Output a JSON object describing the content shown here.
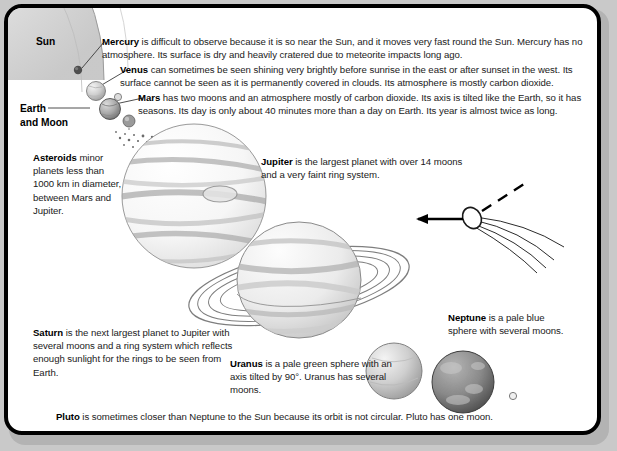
{
  "diagram": {
    "background_color": "#c9c9c9",
    "panel_color": "#ffffff",
    "border_color": "#000000",
    "labels": {
      "sun": "Sun",
      "earth_and_moon": "Earth\nand Moon"
    },
    "entries": [
      {
        "id": "mercury",
        "name": "Mercury",
        "text": " is difficult to observe because it is so near the Sun, and it moves very fast round the Sun. Mercury has no atmosphere. Its surface is dry and heavily cratered due to meteorite impacts long ago."
      },
      {
        "id": "venus",
        "name": "Venus",
        "text": " can sometimes be seen shining very brightly before sunrise in the east or after sunset in the west. Its surface cannot be seen as it is permanently covered in clouds. Its atmosphere is mostly carbon dioxide."
      },
      {
        "id": "mars",
        "name": "Mars",
        "text": " has two moons and an atmosphere mostly of carbon dioxide. Its axis is tilted like the Earth, so it has seasons. Its day is only about 40 minutes more than a day on Earth. Its year is almost twice as long."
      },
      {
        "id": "asteroids",
        "name": "Asteroids",
        "text": " minor planets less than 1000 km in diameter, between Mars and Jupiter."
      },
      {
        "id": "jupiter",
        "name": "Jupiter",
        "text": " is the largest planet with over 14 moons and a very faint ring system."
      },
      {
        "id": "saturn",
        "name": "Saturn",
        "text": " is the next largest planet to Jupiter with several moons and a ring system which reflects enough sunlight for the rings to be seen from Earth."
      },
      {
        "id": "uranus",
        "name": "Uranus",
        "text": " is a pale green sphere with an axis tilted by 90°. Uranus has several moons."
      },
      {
        "id": "neptune",
        "name": "Neptune",
        "text": " is a pale blue sphere with several moons."
      },
      {
        "id": "pluto",
        "name": "Pluto",
        "text": " is sometimes closer than Neptune to the Sun because its orbit is not circular. Pluto has one moon."
      }
    ],
    "illustrations": [
      {
        "name": "sun-arc",
        "description": "large pale arc of the Sun in the top-left corner"
      },
      {
        "name": "mercury-dot",
        "description": "small dark dot"
      },
      {
        "name": "venus-sphere",
        "description": "small light grey sphere"
      },
      {
        "name": "earth-sphere",
        "description": "grey sphere with tiny moon"
      },
      {
        "name": "mars-dot",
        "description": "small grey dot"
      },
      {
        "name": "asteroid-belt",
        "description": "diagonal scatter of tiny dots"
      },
      {
        "name": "jupiter-sphere",
        "description": "large banded sphere"
      },
      {
        "name": "saturn-sphere",
        "description": "banded sphere with rings"
      },
      {
        "name": "comet",
        "description": "comet head with tail, motion arrow and dashed orbit line"
      },
      {
        "name": "uranus-sphere",
        "description": "pale green sphere"
      },
      {
        "name": "neptune-sphere",
        "description": "mottled darker sphere"
      },
      {
        "name": "pluto-dot",
        "description": "tiny circle"
      }
    ]
  }
}
